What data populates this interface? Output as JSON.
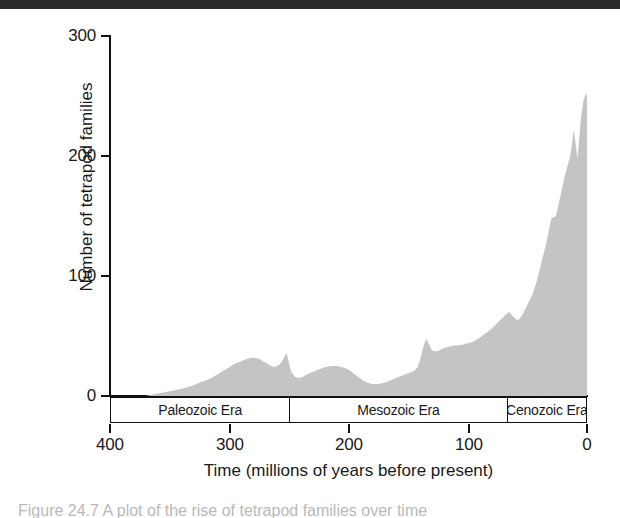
{
  "figure": {
    "background_color": "#ffffff",
    "top_band_color": "#2b2b2b",
    "area_fill_color": "#c4c4c4",
    "axis_color": "#111111",
    "caption_text": "Figure 24.7  A plot of the rise of tetrapod families over time"
  },
  "chart_data": {
    "type": "area",
    "title": "",
    "subtitle": "",
    "xlabel": "Time (millions of years before present)",
    "ylabel": "Number of tetrapod families",
    "xlim": [
      400,
      0
    ],
    "ylim": [
      0,
      300
    ],
    "x_reversed": true,
    "grid": false,
    "legend": null,
    "x_ticks": [
      400,
      300,
      200,
      100,
      0
    ],
    "x_tick_labels": [
      "400",
      "300",
      "200",
      "100",
      "0"
    ],
    "y_ticks": [
      0,
      100,
      200,
      300
    ],
    "y_tick_labels": [
      "0",
      "100",
      "200",
      "300"
    ],
    "series_name": "Number of tetrapod families",
    "x": [
      400,
      390,
      380,
      370,
      365,
      360,
      355,
      350,
      345,
      340,
      335,
      330,
      325,
      320,
      315,
      310,
      305,
      300,
      295,
      290,
      285,
      280,
      275,
      272,
      268,
      265,
      262,
      258,
      255,
      252,
      250,
      248,
      245,
      242,
      238,
      235,
      230,
      225,
      220,
      215,
      210,
      205,
      200,
      196,
      192,
      188,
      184,
      180,
      175,
      170,
      165,
      160,
      155,
      150,
      145,
      142,
      140,
      138,
      135,
      132,
      130,
      127,
      124,
      120,
      116,
      112,
      108,
      104,
      100,
      96,
      92,
      88,
      84,
      80,
      76,
      72,
      68,
      65,
      62,
      58,
      54,
      50,
      46,
      42,
      38,
      34,
      30,
      26,
      22,
      18,
      14,
      11,
      8,
      5,
      3,
      1,
      0
    ],
    "y": [
      0,
      0,
      0,
      0,
      1,
      2,
      3,
      4,
      5,
      6,
      7,
      9,
      11,
      13,
      15,
      18,
      21,
      24,
      27,
      29,
      31,
      32,
      31,
      29,
      27,
      25,
      24,
      26,
      30,
      36,
      28,
      20,
      16,
      15,
      16,
      18,
      20,
      22,
      24,
      25,
      25,
      24,
      22,
      19,
      16,
      13,
      11,
      10,
      10,
      11,
      13,
      15,
      17,
      19,
      21,
      24,
      30,
      38,
      48,
      42,
      38,
      37,
      38,
      40,
      41,
      42,
      42,
      43,
      44,
      45,
      47,
      50,
      53,
      56,
      60,
      64,
      68,
      70,
      66,
      63,
      68,
      76,
      84,
      96,
      112,
      128,
      148,
      150,
      168,
      186,
      200,
      222,
      198,
      232,
      246,
      252,
      250
    ],
    "annotations": [
      {
        "label": "Paleozoic Era",
        "x_start": 400,
        "x_end": 249
      },
      {
        "label": "Mesozoic Era",
        "x_start": 249,
        "x_end": 66
      },
      {
        "label": "Cenozoic Era",
        "x_start": 66,
        "x_end": 0
      }
    ]
  },
  "axes": {
    "y_title": "Number of tetrapod families",
    "x_title": "Time (millions of years before present)"
  },
  "eras": [
    {
      "label": "Paleozoic Era"
    },
    {
      "label": "Mesozoic Era"
    },
    {
      "label": "Cenozoic Era"
    }
  ]
}
